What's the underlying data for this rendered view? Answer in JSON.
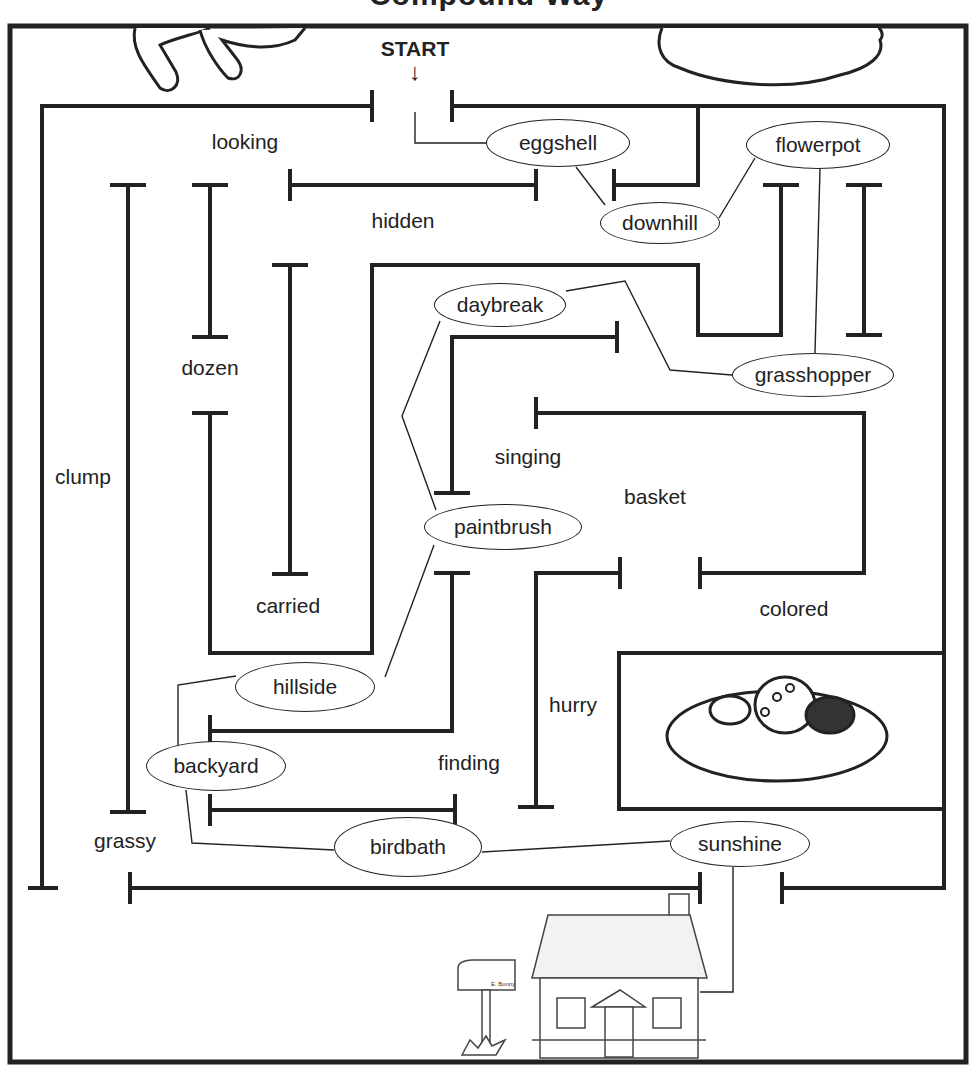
{
  "title": "Compound Way",
  "start": {
    "label": "START",
    "arrow": "↓"
  },
  "maze": {
    "stroke_color": "#222222",
    "background": "#ffffff",
    "path_words": [
      {
        "text": "eggshell",
        "x": 558,
        "y": 143,
        "w": 144,
        "h": 48
      },
      {
        "text": "downhill",
        "x": 660,
        "y": 223,
        "w": 120,
        "h": 42
      },
      {
        "text": "flowerpot",
        "x": 818,
        "y": 145,
        "w": 144,
        "h": 48
      },
      {
        "text": "daybreak",
        "x": 500,
        "y": 305,
        "w": 132,
        "h": 44
      },
      {
        "text": "grasshopper",
        "x": 813,
        "y": 375,
        "w": 162,
        "h": 44
      },
      {
        "text": "paintbrush",
        "x": 503,
        "y": 527,
        "w": 158,
        "h": 46
      },
      {
        "text": "hillside",
        "x": 305,
        "y": 687,
        "w": 140,
        "h": 50
      },
      {
        "text": "backyard",
        "x": 216,
        "y": 766,
        "w": 140,
        "h": 50
      },
      {
        "text": "birdbath",
        "x": 408,
        "y": 847,
        "w": 148,
        "h": 60
      },
      {
        "text": "sunshine",
        "x": 740,
        "y": 844,
        "w": 140,
        "h": 46
      }
    ],
    "distractor_words": [
      {
        "text": "looking",
        "x": 245,
        "y": 142
      },
      {
        "text": "hidden",
        "x": 403,
        "y": 221
      },
      {
        "text": "dozen",
        "x": 210,
        "y": 368
      },
      {
        "text": "clump",
        "x": 83,
        "y": 477
      },
      {
        "text": "singing",
        "x": 528,
        "y": 457
      },
      {
        "text": "basket",
        "x": 655,
        "y": 497
      },
      {
        "text": "carried",
        "x": 288,
        "y": 606
      },
      {
        "text": "colored",
        "x": 794,
        "y": 609
      },
      {
        "text": "hurry",
        "x": 573,
        "y": 705
      },
      {
        "text": "finding",
        "x": 469,
        "y": 763
      },
      {
        "text": "grassy",
        "x": 125,
        "y": 841
      }
    ]
  },
  "illustrations": {
    "top_left": "bunny-feet",
    "top_right": "nest",
    "middle_right": "nest-with-eggs",
    "bottom": "house",
    "mailbox_label": "E. Bunny"
  }
}
